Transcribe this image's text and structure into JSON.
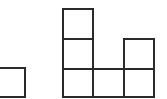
{
  "diagram": {
    "stroke_color": "#2a2a2a",
    "background": "#ffffff",
    "cell_size": 30,
    "cells": [
      {
        "id": "left-partial",
        "x": -6,
        "y": 67,
        "w": 32,
        "h": 31
      },
      {
        "id": "col1-row1",
        "x": 62,
        "y": 8,
        "w": 32,
        "h": 32
      },
      {
        "id": "col1-row2",
        "x": 62,
        "y": 38,
        "w": 32,
        "h": 32
      },
      {
        "id": "col1-row3",
        "x": 62,
        "y": 68,
        "w": 32,
        "h": 30
      },
      {
        "id": "col2-row3",
        "x": 92,
        "y": 68,
        "w": 33,
        "h": 30
      },
      {
        "id": "col3-row2",
        "x": 123,
        "y": 38,
        "w": 32,
        "h": 32
      },
      {
        "id": "col3-row3",
        "x": 123,
        "y": 68,
        "w": 32,
        "h": 30
      }
    ]
  }
}
